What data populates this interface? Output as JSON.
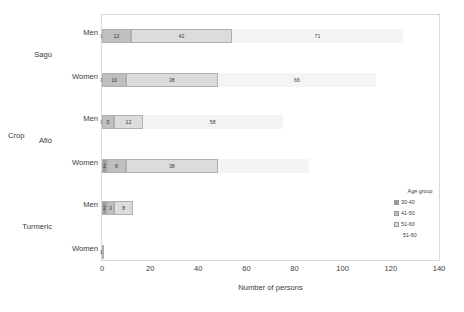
{
  "axis_titles": {
    "y": "Crop",
    "x": "Number of persons"
  },
  "legend": {
    "title": "Age group",
    "items": [
      {
        "label": "30-40",
        "color": "#9c9c9c"
      },
      {
        "label": "41-50",
        "color": "#bfbfbf"
      },
      {
        "label": "51-60",
        "color": "#dcdcdc"
      },
      {
        "label": "51-60",
        "color": "#f4f4f4"
      }
    ]
  },
  "groups": [
    {
      "name": "Sagú",
      "rows": [
        "Men",
        "Women"
      ]
    },
    {
      "name": "Afió",
      "rows": [
        "Men",
        "Women"
      ]
    },
    {
      "name": "Turmeric",
      "rows": [
        "Men",
        "Women"
      ]
    }
  ],
  "chart_data": {
    "type": "bar",
    "orientation": "horizontal",
    "stacked": true,
    "title": "",
    "xlabel": "Number of persons",
    "ylabel": "Crop",
    "xlim": [
      0,
      140
    ],
    "xticks": [
      0,
      20,
      40,
      60,
      80,
      100,
      120,
      140
    ],
    "grid": false,
    "legend_title": "Age group",
    "legend_position": "right",
    "categories": [
      "Sagú - Men",
      "Sagú - Women",
      "Afió - Men",
      "Afió - Women",
      "Turmeric - Men",
      "Turmeric - Women"
    ],
    "series": [
      {
        "name": "30-40",
        "color": "#9c9c9c",
        "values": [
          0,
          0,
          0,
          2,
          2,
          0
        ]
      },
      {
        "name": "41-50",
        "color": "#bfbfbf",
        "values": [
          12,
          10,
          5,
          8,
          3,
          0
        ]
      },
      {
        "name": "51-60",
        "color": "#dcdcdc",
        "values": [
          42,
          38,
          12,
          38,
          8,
          1
        ]
      },
      {
        "name": "51-60",
        "color": "#f4f4f4",
        "values": [
          71,
          66,
          58,
          38,
          0,
          0
        ]
      }
    ],
    "bar_labels": [
      [
        "0",
        "12",
        "42",
        "71"
      ],
      [
        "0",
        "10",
        "38",
        "66"
      ],
      [
        "0",
        "5",
        "12",
        "58"
      ],
      [
        "2",
        "8",
        "38",
        ""
      ],
      [
        "2",
        "3",
        "8",
        ""
      ],
      [
        "0",
        "1",
        "",
        ""
      ]
    ]
  }
}
